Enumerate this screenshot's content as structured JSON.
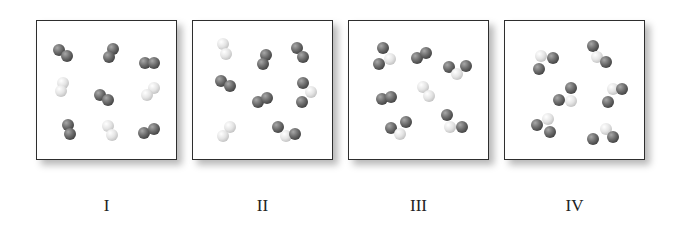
{
  "colors": {
    "dark_atom": "#6e6e6e",
    "light_atom": "#e4e4e4",
    "border": "#2e2e2e"
  },
  "panels": [
    {
      "label": "I",
      "left": 36,
      "description": "Homonuclear diatomics: 6 dark-dark, 3 light-light",
      "molecules": [
        {
          "atoms": [
            [
              "d",
              22,
              29
            ],
            [
              "d",
              30,
              35
            ]
          ]
        },
        {
          "atoms": [
            [
              "d",
              76,
              28
            ],
            [
              "d",
              72,
              36
            ]
          ]
        },
        {
          "atoms": [
            [
              "d",
              108,
              42
            ],
            [
              "d",
              117,
              42
            ]
          ]
        },
        {
          "atoms": [
            [
              "l",
              26,
              62
            ],
            [
              "l",
              24,
              70
            ]
          ]
        },
        {
          "atoms": [
            [
              "d",
              63,
              74
            ],
            [
              "d",
              71,
              79
            ]
          ]
        },
        {
          "atoms": [
            [
              "l",
              117,
              67
            ],
            [
              "l",
              110,
              74
            ]
          ]
        },
        {
          "atoms": [
            [
              "d",
              31,
              104
            ],
            [
              "d",
              33,
              113
            ]
          ]
        },
        {
          "atoms": [
            [
              "l",
              71,
              105
            ],
            [
              "l",
              75,
              114
            ]
          ]
        },
        {
          "atoms": [
            [
              "d",
              107,
              112
            ],
            [
              "d",
              117,
              108
            ]
          ]
        }
      ]
    },
    {
      "label": "II",
      "left": 192,
      "description": "Mixture: light-light, dark-dark and one dark-light-dark triatomic",
      "molecules": [
        {
          "atoms": [
            [
              "l",
              30,
              23
            ],
            [
              "l",
              33,
              33
            ]
          ]
        },
        {
          "atoms": [
            [
              "d",
              73,
              34
            ],
            [
              "d",
              70,
              43
            ]
          ]
        },
        {
          "atoms": [
            [
              "d",
              104,
              27
            ],
            [
              "d",
              110,
              36
            ]
          ]
        },
        {
          "atoms": [
            [
              "d",
              28,
              60
            ],
            [
              "d",
              37,
              65
            ]
          ]
        },
        {
          "atoms": [
            [
              "d",
              110,
              62
            ],
            [
              "l",
              118,
              71
            ]
          ]
        },
        {
          "atoms": [
            [
              "d",
              109,
              81
            ]
          ]
        },
        {
          "atoms": [
            [
              "d",
              65,
              81
            ],
            [
              "d",
              74,
              77
            ]
          ]
        },
        {
          "atoms": [
            [
              "l",
              37,
              106
            ],
            [
              "l",
              30,
              115
            ]
          ]
        },
        {
          "atoms": [
            [
              "d",
              85,
              106
            ],
            [
              "l",
              93,
              115
            ],
            [
              "d",
              102,
              113
            ]
          ]
        }
      ]
    },
    {
      "label": "III",
      "left": 348,
      "description": "Mostly dark-light heteronuclear pairs plus dark-dark and light-light",
      "molecules": [
        {
          "atoms": [
            [
              "d",
              34,
              27
            ],
            [
              "l",
              41,
              38
            ],
            [
              "d",
              30,
              43
            ]
          ]
        },
        {
          "atoms": [
            [
              "d",
              68,
              37
            ],
            [
              "d",
              77,
              32
            ]
          ]
        },
        {
          "atoms": [
            [
              "d",
              100,
              46
            ],
            [
              "l",
              108,
              53
            ],
            [
              "d",
              117,
              45
            ]
          ]
        },
        {
          "atoms": [
            [
              "l",
              74,
              66
            ],
            [
              "l",
              80,
              75
            ]
          ]
        },
        {
          "atoms": [
            [
              "d",
              33,
              78
            ],
            [
              "d",
              42,
              76
            ]
          ]
        },
        {
          "atoms": [
            [
              "d",
              42,
              107
            ],
            [
              "l",
              51,
              113
            ],
            [
              "d",
              57,
              101
            ]
          ]
        },
        {
          "atoms": [
            [
              "d",
              98,
              94
            ],
            [
              "l",
              101,
              106
            ],
            [
              "d",
              113,
              106
            ]
          ]
        }
      ]
    },
    {
      "label": "IV",
      "left": 504,
      "description": "All dark-light-dark triatomic molecules (light atom central)",
      "molecules": [
        {
          "atoms": [
            [
              "l",
              36,
              35
            ],
            [
              "d",
              48,
              37
            ],
            [
              "d",
              34,
              48
            ]
          ]
        },
        {
          "atoms": [
            [
              "d",
              88,
              25
            ],
            [
              "l",
              92,
              36
            ],
            [
              "d",
              101,
              41
            ]
          ]
        },
        {
          "atoms": [
            [
              "d",
              66,
              67
            ],
            [
              "l",
              66,
              80
            ],
            [
              "d",
              54,
              79
            ]
          ]
        },
        {
          "atoms": [
            [
              "l",
              108,
              68
            ],
            [
              "d",
              117,
              68
            ],
            [
              "d",
              103,
              81
            ]
          ]
        },
        {
          "atoms": [
            [
              "l",
              43,
              98
            ],
            [
              "d",
              32,
              104
            ],
            [
              "d",
              45,
              111
            ]
          ]
        },
        {
          "atoms": [
            [
              "l",
              101,
              108
            ],
            [
              "d",
              88,
              118
            ],
            [
              "d",
              108,
              116
            ]
          ]
        }
      ]
    }
  ]
}
